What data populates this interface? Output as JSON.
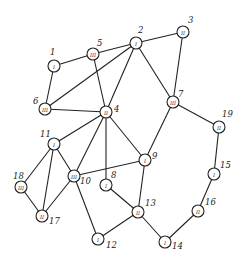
{
  "nodes": [
    {
      "id": "1",
      "roman": "I",
      "x": 54,
      "y": 66,
      "lx": 50,
      "ly": 55
    },
    {
      "id": "2",
      "roman": "I",
      "x": 136,
      "y": 43,
      "lx": 138,
      "ly": 33
    },
    {
      "id": "3",
      "roman": "II",
      "x": 183,
      "y": 32,
      "lx": 188,
      "ly": 23
    },
    {
      "id": "4",
      "roman": "II",
      "x": 106,
      "y": 112,
      "lx": 114,
      "ly": 112
    },
    {
      "id": "5",
      "roman": "III",
      "x": 93,
      "y": 54,
      "lx": 97,
      "ly": 46
    },
    {
      "id": "6",
      "roman": "III",
      "x": 45,
      "y": 109,
      "lx": 33,
      "ly": 104
    },
    {
      "id": "7",
      "roman": "III",
      "x": 173,
      "y": 102,
      "lx": 178,
      "ly": 97
    },
    {
      "id": "8",
      "roman": "I",
      "x": 106,
      "y": 185,
      "lx": 111,
      "ly": 178
    },
    {
      "id": "9",
      "roman": "I",
      "x": 145,
      "y": 160,
      "lx": 152,
      "ly": 159
    },
    {
      "id": "10",
      "roman": "III",
      "x": 74,
      "y": 176,
      "lx": 80,
      "ly": 184
    },
    {
      "id": "11",
      "roman": "I",
      "x": 54,
      "y": 144,
      "lx": 40,
      "ly": 137
    },
    {
      "id": "12",
      "roman": "I",
      "x": 98,
      "y": 239,
      "lx": 106,
      "ly": 248
    },
    {
      "id": "13",
      "roman": "II",
      "x": 138,
      "y": 212,
      "lx": 145,
      "ly": 206
    },
    {
      "id": "14",
      "roman": "I",
      "x": 165,
      "y": 242,
      "lx": 172,
      "ly": 249
    },
    {
      "id": "15",
      "roman": "I",
      "x": 214,
      "y": 174,
      "lx": 220,
      "ly": 168
    },
    {
      "id": "16",
      "roman": "II",
      "x": 198,
      "y": 211,
      "lx": 205,
      "ly": 205
    },
    {
      "id": "17",
      "roman": "II",
      "x": 42,
      "y": 216,
      "lx": 49,
      "ly": 224
    },
    {
      "id": "18",
      "roman": "III",
      "x": 21,
      "y": 187,
      "lx": 13,
      "ly": 179
    },
    {
      "id": "19",
      "roman": "II",
      "x": 219,
      "y": 127,
      "lx": 222,
      "ly": 117
    }
  ],
  "edges": [
    [
      "1",
      "5"
    ],
    [
      "1",
      "6"
    ],
    [
      "5",
      "2"
    ],
    [
      "5",
      "4"
    ],
    [
      "6",
      "2"
    ],
    [
      "6",
      "4"
    ],
    [
      "2",
      "4"
    ],
    [
      "2",
      "3"
    ],
    [
      "2",
      "7"
    ],
    [
      "3",
      "7"
    ],
    [
      "4",
      "11"
    ],
    [
      "4",
      "10"
    ],
    [
      "4",
      "8"
    ],
    [
      "4",
      "9"
    ],
    [
      "7",
      "9"
    ],
    [
      "7",
      "19"
    ],
    [
      "19",
      "15"
    ],
    [
      "15",
      "16"
    ],
    [
      "16",
      "14"
    ],
    [
      "14",
      "13"
    ],
    [
      "9",
      "13"
    ],
    [
      "8",
      "13"
    ],
    [
      "13",
      "12"
    ],
    [
      "10",
      "9"
    ],
    [
      "10",
      "12"
    ],
    [
      "11",
      "10"
    ],
    [
      "11",
      "18"
    ],
    [
      "11",
      "17"
    ],
    [
      "18",
      "17"
    ],
    [
      "10",
      "17"
    ]
  ]
}
